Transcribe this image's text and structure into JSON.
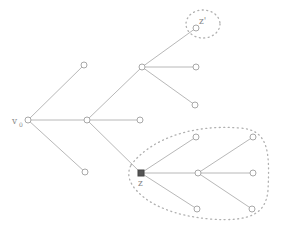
{
  "diagram": {
    "type": "tree",
    "colors": {
      "edge": "#b8b8b8",
      "node_stroke": "#a8a8a8",
      "highlight_node": "#555555",
      "region": "#b0b0b0"
    },
    "labels": {
      "root": "v",
      "root_sub": "0",
      "z": "z",
      "z_prime": "z'"
    },
    "nodes": [
      {
        "id": "v0",
        "x": 28,
        "y": 120,
        "label": "v0"
      },
      {
        "id": "a",
        "x": 84,
        "y": 65
      },
      {
        "id": "b",
        "x": 87,
        "y": 120
      },
      {
        "id": "c",
        "x": 85,
        "y": 172
      },
      {
        "id": "d",
        "x": 142,
        "y": 67
      },
      {
        "id": "e",
        "x": 140,
        "y": 120
      },
      {
        "id": "z",
        "x": 141,
        "y": 173,
        "label": "z",
        "highlight": true
      },
      {
        "id": "zp",
        "x": 196,
        "y": 28,
        "label": "z'"
      },
      {
        "id": "d2",
        "x": 196,
        "y": 67
      },
      {
        "id": "d3",
        "x": 195,
        "y": 105
      },
      {
        "id": "z1",
        "x": 196,
        "y": 137
      },
      {
        "id": "f",
        "x": 198,
        "y": 173
      },
      {
        "id": "z3",
        "x": 197,
        "y": 209
      },
      {
        "id": "f1",
        "x": 253,
        "y": 137
      },
      {
        "id": "f2",
        "x": 253,
        "y": 173
      },
      {
        "id": "f3",
        "x": 252,
        "y": 209
      }
    ],
    "edges": [
      [
        "v0",
        "a"
      ],
      [
        "v0",
        "b"
      ],
      [
        "v0",
        "c"
      ],
      [
        "b",
        "d"
      ],
      [
        "b",
        "e"
      ],
      [
        "b",
        "z"
      ],
      [
        "d",
        "zp"
      ],
      [
        "d",
        "d2"
      ],
      [
        "d",
        "d3"
      ],
      [
        "z",
        "z1"
      ],
      [
        "z",
        "f"
      ],
      [
        "z",
        "z3"
      ],
      [
        "f",
        "f1"
      ],
      [
        "f",
        "f2"
      ],
      [
        "f",
        "f3"
      ]
    ],
    "regions": [
      {
        "name": "z-prime-region",
        "encloses": [
          "zp"
        ]
      },
      {
        "name": "z-subtree-region",
        "encloses": [
          "z",
          "z1",
          "f",
          "z3",
          "f1",
          "f2",
          "f3"
        ]
      }
    ]
  }
}
